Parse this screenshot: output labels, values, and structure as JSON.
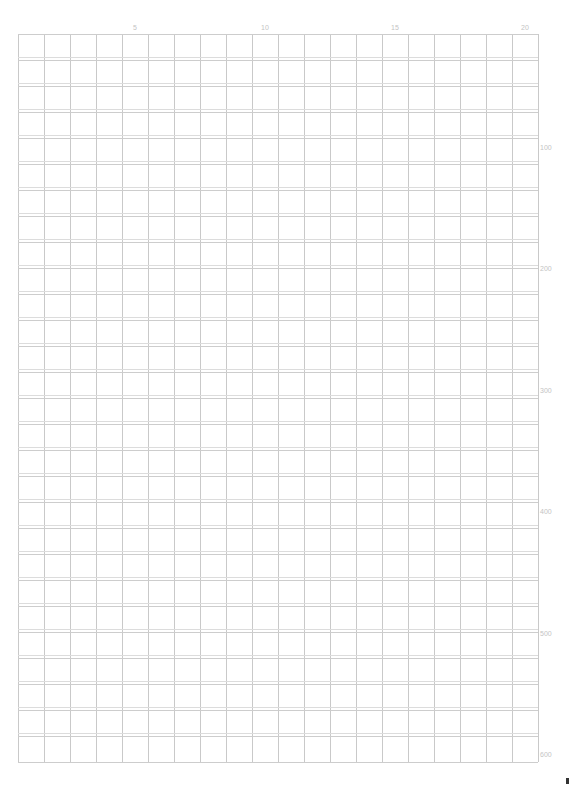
{
  "sheet": {
    "type": "manuscript-grid-paper",
    "columns": 20,
    "rows": 28,
    "cell_width_px": 26,
    "row_pitch_px": 26,
    "line_color": "#c9c9c9",
    "background": "#ffffff"
  },
  "column_labels": [
    {
      "col": 5,
      "text": "5"
    },
    {
      "col": 10,
      "text": "10"
    },
    {
      "col": 15,
      "text": "15"
    },
    {
      "col": 20,
      "text": "20"
    }
  ],
  "row_labels": [
    {
      "row": 5,
      "text": "100"
    },
    {
      "row": 10,
      "text": "200"
    },
    {
      "row": 15,
      "text": "300"
    },
    {
      "row": 20,
      "text": "400"
    },
    {
      "row": 25,
      "text": "500"
    },
    {
      "row": 30,
      "text": "600"
    }
  ]
}
